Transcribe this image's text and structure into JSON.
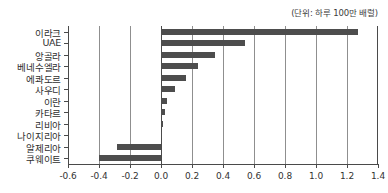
{
  "unit_note": "(단위: 하루 100만 배럴)",
  "chart_data": {
    "type": "bar",
    "orientation": "horizontal",
    "title": "",
    "subtitle": "(단위: 하루 100만 배럴)",
    "xlabel": "",
    "ylabel": "",
    "xlim": [
      -0.6,
      1.4
    ],
    "xticks": [
      -0.6,
      -0.4,
      -0.2,
      0.0,
      0.2,
      0.4,
      0.6,
      0.8,
      1.0,
      1.2,
      1.4
    ],
    "xticklabels": [
      "-0.6",
      "-0.4",
      "-0.2",
      "0.0",
      "0.2",
      "0.4",
      "0.6",
      "0.8",
      "1.0",
      "1.2",
      "1.4"
    ],
    "grid": "vertical",
    "legend": "none",
    "bar_color": "#4d4d4d",
    "categories": [
      "이라크",
      "UAE",
      "앙골라",
      "베네수엘라",
      "에콰도르",
      "사우디",
      "이란",
      "카타르",
      "리비아",
      "나이지리아",
      "알제리아",
      "쿠웨이트"
    ],
    "values": [
      1.27,
      0.54,
      0.35,
      0.24,
      0.16,
      0.09,
      0.04,
      0.025,
      0.01,
      0.003,
      -0.285,
      -0.4
    ]
  }
}
